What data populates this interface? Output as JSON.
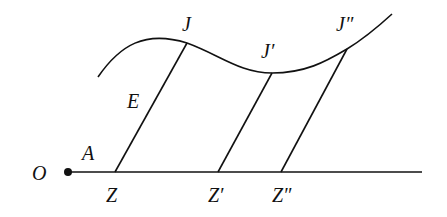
{
  "diagram": {
    "type": "geometric construction",
    "stroke_color": "#111111",
    "labels": {
      "O": "O",
      "A": "A",
      "E": "E",
      "Z": "Z",
      "Z1": "Z′",
      "Z2": "Z″",
      "J": "J",
      "J1": "J′",
      "J2": "J″"
    },
    "points": {
      "O": [
        68,
        172
      ],
      "Z": [
        115,
        172
      ],
      "Z1": [
        218,
        172
      ],
      "Z2": [
        281,
        172
      ],
      "J": [
        187,
        43
      ],
      "J1": [
        272,
        73
      ],
      "J2": [
        347,
        49
      ]
    },
    "baseline": {
      "from": [
        68,
        172
      ],
      "to": [
        422,
        172
      ]
    },
    "curve": "M98,77 C120,45 145,30 187,43 C220,55 240,73 272,73 C305,73 325,62 347,49 C365,38 380,25 392,14",
    "segments": [
      {
        "from": "Z",
        "to": "J"
      },
      {
        "from": "Z1",
        "to": "J1"
      },
      {
        "from": "Z2",
        "to": "J2"
      }
    ]
  }
}
